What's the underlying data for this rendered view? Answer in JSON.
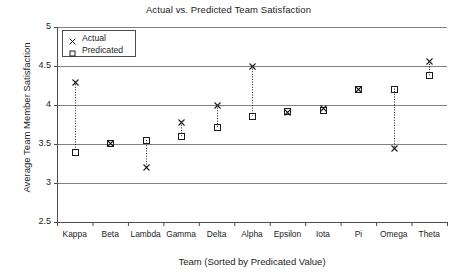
{
  "chart_data": {
    "type": "scatter",
    "title": "Actual vs. Predicted Team Satisfaction",
    "xlabel": "Team (Sorted by Predicated Value)",
    "ylabel": "Average Team Member Satisfaction",
    "categories": [
      "Kappa",
      "Beta",
      "Lambda",
      "Gamma",
      "Delta",
      "Alpha",
      "Epsilon",
      "Iota",
      "Pi",
      "Omega",
      "Theta"
    ],
    "ylim": [
      2.5,
      5
    ],
    "yticks": [
      "2.5",
      "3",
      "3.5",
      "4",
      "4.5",
      "5"
    ],
    "ytick_values": [
      2.5,
      3,
      3.5,
      4,
      4.5,
      5
    ],
    "grid": "horizontal",
    "legend_position": "top-left",
    "series": [
      {
        "name": "Actual",
        "marker": "x-marker",
        "values": [
          4.3,
          3.51,
          3.21,
          3.78,
          4.0,
          4.5,
          3.91,
          3.96,
          4.2,
          3.45,
          4.56
        ]
      },
      {
        "name": "Predicated",
        "marker": "square-marker",
        "values": [
          3.4,
          3.51,
          3.55,
          3.6,
          3.72,
          3.86,
          3.92,
          3.94,
          4.2,
          4.21,
          4.38
        ]
      }
    ],
    "connector": "dotted-vertical-line",
    "colors": {
      "marker": "#1a1a1a",
      "grid": "#808080",
      "axis": "#4d4d4d",
      "background": "#ffffff"
    }
  }
}
